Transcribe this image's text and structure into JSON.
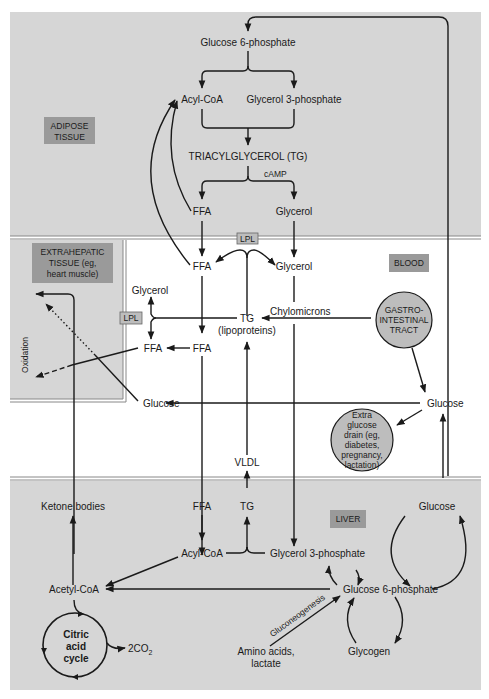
{
  "colors": {
    "tissue_bg": "#d6d6d6",
    "blood_bg": "#ffffff",
    "label_box": "#9a9a9a",
    "circle_fill": "#bdbdbd",
    "line": "#1a1a1a"
  },
  "regions": {
    "adipose": "ADIPOSE|TISSUE",
    "extrahepatic": "EXTRAHEPATIC|TISSUE (eg,|heart muscle)",
    "blood": "BLOOD",
    "liver": "LIVER"
  },
  "adipose": {
    "glucose6p": "Glucose 6-phosphate",
    "acylcoa": "Acyl-CoA",
    "glycerol3p": "Glycerol 3-phosphate",
    "tg": "TRIACYLGLYCEROL (TG)",
    "camp": "cAMP",
    "ffa": "FFA",
    "glycerol": "Glycerol"
  },
  "blood": {
    "lpl_top": "LPL",
    "ffa": "FFA",
    "glycerol": "Glycerol",
    "chylomicrons": "Chylomicrons",
    "tg": "TG",
    "lipoproteins": "(lipoproteins)",
    "ffa_mid": "FFA",
    "glucose_right": "Glucose",
    "vldl": "VLDL",
    "gi_tract": "GASTRO-|INTESTINAL|TRACT",
    "extra_glucose_drain": "Extra|glucose|drain (eg,|diabetes,|pregnancy,|lactation)"
  },
  "extrahepatic": {
    "glycerol": "Glycerol",
    "lpl": "LPL",
    "ffa": "FFA",
    "glucose": "Glucose",
    "oxidation": "Oxidation"
  },
  "liver": {
    "ketone_bodies": "Ketone bodies",
    "ffa": "FFA",
    "tg": "TG",
    "acylcoa": "Acyl-CoA",
    "glycerol3p": "Glycerol 3-phosphate",
    "acetylcoa": "Acetyl-CoA",
    "glucose6p": "Glucose 6-phosphate",
    "glucose": "Glucose",
    "gluconeogenesis": "Gluconeogenesis",
    "amino_acids": "Amino acids,|lactate",
    "glycogen": "Glycogen",
    "citric_cycle": "Citric|acid|cycle",
    "co2": "2CO",
    "co2_sub": "2"
  }
}
